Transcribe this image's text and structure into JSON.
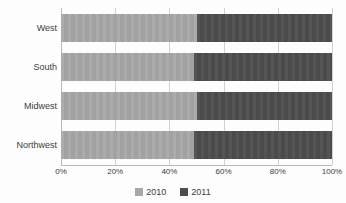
{
  "chart_data": {
    "type": "bar",
    "orientation": "horizontal",
    "stacked": true,
    "stack_mode": "percent",
    "title": "",
    "xlabel": "",
    "ylabel": "",
    "xlim": [
      0,
      100
    ],
    "grid": true,
    "legend_position": "bottom",
    "categories": [
      "West",
      "South",
      "Midwest",
      "Northwest"
    ],
    "x_tick_labels": [
      "0%",
      "20%",
      "40%",
      "60%",
      "80%",
      "100%"
    ],
    "x_tick_values": [
      0,
      20,
      40,
      60,
      80,
      100
    ],
    "series": [
      {
        "name": "2010",
        "color": "#a8a8a8",
        "values": [
          50,
          49,
          50,
          49
        ]
      },
      {
        "name": "2011",
        "color": "#4d4d4d",
        "values": [
          50,
          51,
          50,
          51
        ]
      }
    ]
  },
  "legend": {
    "items": [
      {
        "label": "2010",
        "color": "#a8a8a8"
      },
      {
        "label": "2011",
        "color": "#4d4d4d"
      }
    ]
  },
  "colors": {
    "background": "#fdfdfd",
    "gridline": "#d2d2d2",
    "axis": "#b9b9b9",
    "text": "#3c3c3c",
    "series_2010": "#a8a8a8",
    "series_2011": "#4d4d4d"
  }
}
